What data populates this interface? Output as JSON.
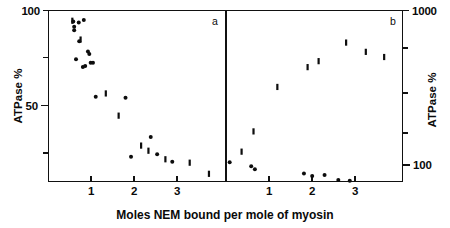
{
  "figure": {
    "xlabel": "Moles NEM  bound  per  mole of myosin",
    "panel_a_label": "a",
    "panel_b_label": "b",
    "left_axis_title": "ATPase  %",
    "right_axis_title": "ATPase  %",
    "left_ticks": [
      "100",
      "50"
    ],
    "right_ticks": [
      "1000",
      "100"
    ]
  },
  "chart_data": [
    {
      "type": "scatter",
      "panel": "a",
      "title": "",
      "xlabel": "Moles NEM bound per mole of myosin",
      "ylabel": "ATPase %",
      "xlim": [
        0,
        3.85
      ],
      "ylim": [
        0,
        100
      ],
      "yscale": "linear",
      "xticks": [
        1,
        2,
        3
      ],
      "yticks": [
        50,
        100
      ],
      "y_minor_ticks": [
        25,
        75
      ],
      "grid": false,
      "legend": false,
      "series": [
        {
          "name": "filled circle",
          "marker": "filled-circle",
          "points": [
            {
              "x": 0.54,
              "y": 93.5
            },
            {
              "x": 0.56,
              "y": 90.5
            },
            {
              "x": 0.56,
              "y": 88.5
            },
            {
              "x": 0.66,
              "y": 93.0
            },
            {
              "x": 0.77,
              "y": 94.5
            },
            {
              "x": 0.67,
              "y": 82.0
            },
            {
              "x": 0.6,
              "y": 71.5
            },
            {
              "x": 0.86,
              "y": 76.0
            },
            {
              "x": 0.89,
              "y": 74.5
            },
            {
              "x": 0.75,
              "y": 67.0
            },
            {
              "x": 0.8,
              "y": 67.5
            },
            {
              "x": 0.92,
              "y": 69.5
            },
            {
              "x": 0.97,
              "y": 69.5
            },
            {
              "x": 1.03,
              "y": 49.5
            },
            {
              "x": 1.68,
              "y": 49.0
            },
            {
              "x": 2.23,
              "y": 26.0
            },
            {
              "x": 1.8,
              "y": 14.5
            },
            {
              "x": 2.37,
              "y": 16.0
            },
            {
              "x": 2.7,
              "y": 11.5
            }
          ]
        },
        {
          "name": "vertical bar",
          "marker": "vertical-bar",
          "points": [
            {
              "x": 0.52,
              "y": 94.0
            },
            {
              "x": 0.7,
              "y": 83.0
            },
            {
              "x": 1.25,
              "y": 51.5
            },
            {
              "x": 1.53,
              "y": 38.5
            },
            {
              "x": 2.02,
              "y": 21.0
            },
            {
              "x": 2.18,
              "y": 18.0
            },
            {
              "x": 2.55,
              "y": 13.0
            },
            {
              "x": 3.08,
              "y": 11.0
            },
            {
              "x": 3.5,
              "y": 4.5
            }
          ]
        }
      ]
    },
    {
      "type": "scatter",
      "panel": "b",
      "title": "",
      "xlabel": "Moles NEM bound per mole of myosin",
      "ylabel": "ATPase %",
      "xlim": [
        0,
        3.85
      ],
      "ylim": [
        70,
        1000
      ],
      "yscale": "log",
      "xticks": [
        1,
        2,
        3
      ],
      "yticks": [
        100,
        1000
      ],
      "y_minor_ticks": [
        200,
        300,
        500,
        700
      ],
      "grid": false,
      "legend": false,
      "series": [
        {
          "name": "vertical bar",
          "marker": "vertical-bar",
          "points": [
            {
              "x": 0.34,
              "y": 122
            },
            {
              "x": 0.6,
              "y": 165
            },
            {
              "x": 1.12,
              "y": 320
            },
            {
              "x": 1.78,
              "y": 430
            },
            {
              "x": 2.02,
              "y": 470
            },
            {
              "x": 2.62,
              "y": 620
            },
            {
              "x": 3.05,
              "y": 540
            },
            {
              "x": 3.45,
              "y": 500
            }
          ]
        },
        {
          "name": "filled circle",
          "marker": "filled-circle",
          "points": [
            {
              "x": 0.08,
              "y": 104
            },
            {
              "x": 0.55,
              "y": 98
            },
            {
              "x": 0.63,
              "y": 94
            },
            {
              "x": 1.7,
              "y": 88
            },
            {
              "x": 1.88,
              "y": 85
            },
            {
              "x": 2.15,
              "y": 86
            },
            {
              "x": 2.45,
              "y": 80
            },
            {
              "x": 2.7,
              "y": 79
            }
          ]
        }
      ]
    }
  ]
}
